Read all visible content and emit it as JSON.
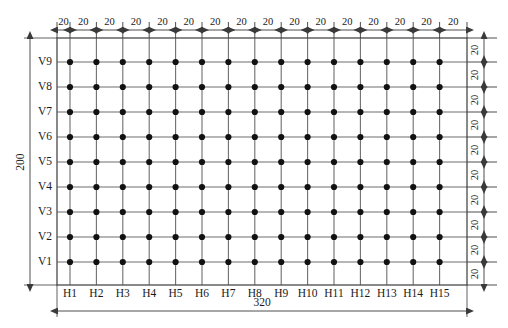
{
  "diagram": {
    "type": "engineering-dimension-grid",
    "geometry": {
      "grid_left": 57,
      "grid_right": 467,
      "grid_top": 38,
      "grid_bottom": 285,
      "first_col_x": 70,
      "col_step": 26.4,
      "first_row_y": 62,
      "row_step": 25,
      "columns": 15,
      "rows": 9,
      "dot_radius": 3.1
    },
    "colors": {
      "line": "#6e6e6e",
      "border": "#4a4a4a",
      "dot": "#111111",
      "dim": "#3a3a3a",
      "text": "#1a1a1a",
      "background": "#ffffff"
    },
    "column_labels": [
      "H1",
      "H2",
      "H3",
      "H4",
      "H5",
      "H6",
      "H7",
      "H8",
      "H9",
      "H10",
      "H11",
      "H12",
      "H13",
      "H14",
      "H15"
    ],
    "row_labels": [
      "V9",
      "V8",
      "V7",
      "V6",
      "V5",
      "V4",
      "V3",
      "V2",
      "V1"
    ],
    "top_dimensions": [
      "20",
      "20",
      "20",
      "20",
      "20",
      "20",
      "20",
      "20",
      "20",
      "20",
      "20",
      "20",
      "20",
      "20",
      "20",
      "20"
    ],
    "right_dimensions": [
      "20",
      "20",
      "20",
      "20",
      "20",
      "20",
      "20",
      "20",
      "20",
      "20"
    ],
    "overall_width_label": "320",
    "overall_height_label": "200",
    "spacing_value": "20"
  }
}
